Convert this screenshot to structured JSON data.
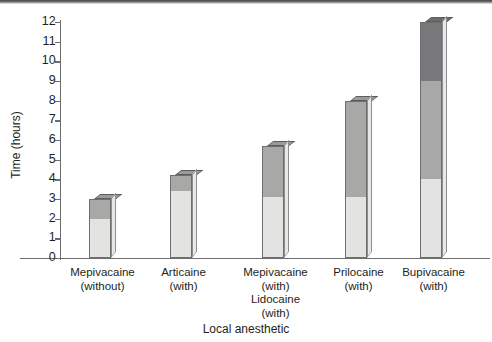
{
  "chart_data": {
    "type": "bar",
    "title": "",
    "xlabel": "Local anesthetic",
    "ylabel": "Time (hours)",
    "ylim": [
      0,
      12
    ],
    "yticks": [
      0,
      1,
      2,
      3,
      4,
      5,
      6,
      7,
      8,
      9,
      10,
      11,
      12
    ],
    "grid": false,
    "legend": null,
    "stacked": true,
    "categories": [
      "Mepivacaine (without)",
      "Articaine (with)",
      "Mepivacaine (with) Lidocaine (with)",
      "Prilocaine (with)",
      "Bupivacaine (with)"
    ],
    "category_lines": [
      [
        "Mepivacaine",
        "(without)"
      ],
      [
        "Articaine",
        "(with)"
      ],
      [
        "Mepivacaine",
        "(with)",
        "Lidocaine",
        "(with)"
      ],
      [
        "Prilocaine",
        "(with)"
      ],
      [
        "Bupivacaine",
        "(with)"
      ]
    ],
    "series": [
      {
        "name": "light-segment",
        "color": "#e3e3e1",
        "values": [
          2.0,
          3.4,
          3.1,
          3.1,
          4.0
        ]
      },
      {
        "name": "mid-segment",
        "color": "#a8a8a6",
        "values": [
          1.0,
          0.8,
          2.6,
          4.9,
          5.0
        ]
      },
      {
        "name": "dark-segment",
        "color": "#78787a",
        "values": [
          0.0,
          0.0,
          0.0,
          0.0,
          3.0
        ]
      }
    ],
    "totals": [
      3.0,
      4.2,
      5.7,
      8.0,
      12.0
    ]
  },
  "colors": {
    "axis": "#6e6e70",
    "text": "#231f20",
    "background": "#ffffff",
    "segment_light": "#e3e3e1",
    "segment_mid": "#a8a8a6",
    "segment_dark": "#78787a",
    "top_band": "#4a4a4e"
  }
}
